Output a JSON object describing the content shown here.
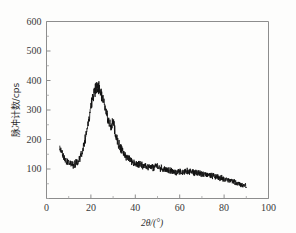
{
  "chart_data": {
    "type": "line",
    "title": "",
    "subtitle": "",
    "xlabel": "2θ/(°)",
    "ylabel": "脉冲计数/cps",
    "xlim": [
      0,
      100
    ],
    "ylim": [
      0,
      600
    ],
    "xticks": [
      0,
      20,
      40,
      60,
      80,
      100
    ],
    "xtick_labels": [
      "0",
      "20",
      "40",
      "60",
      "80",
      "100"
    ],
    "yticks": [
      100,
      200,
      300,
      400,
      500,
      600
    ],
    "ytick_labels": [
      "100",
      "200",
      "300",
      "400",
      "500",
      "600"
    ],
    "x_minor_step": 10,
    "y_minor_step": 50,
    "grid": false,
    "legend": null,
    "series_name": "XRD intensity",
    "series_color": "#111111",
    "noise_amplitude": 13,
    "x": [
      6,
      7,
      8,
      9,
      10,
      11,
      12,
      13,
      14,
      15,
      16,
      17,
      18,
      19,
      20,
      21,
      22,
      23,
      24,
      25,
      26,
      27,
      28,
      29,
      30,
      31,
      32,
      33,
      34,
      35,
      36,
      37,
      38,
      39,
      40,
      42,
      44,
      46,
      48,
      50,
      52,
      54,
      56,
      58,
      60,
      62,
      64,
      66,
      68,
      70,
      72,
      74,
      76,
      78,
      80,
      82,
      84,
      86,
      88,
      90
    ],
    "y": [
      172,
      152,
      138,
      128,
      122,
      118,
      116,
      118,
      124,
      136,
      155,
      186,
      225,
      268,
      310,
      345,
      372,
      382,
      372,
      350,
      322,
      292,
      262,
      238,
      268,
      222,
      196,
      178,
      164,
      152,
      142,
      134,
      128,
      124,
      120,
      114,
      110,
      106,
      104,
      112,
      100,
      96,
      94,
      92,
      90,
      90,
      92,
      88,
      86,
      84,
      80,
      78,
      74,
      70,
      66,
      62,
      58,
      52,
      46,
      44
    ],
    "annotations": [
      {
        "label": "broad amorphous halo",
        "x": 23,
        "y": 382
      },
      {
        "label": "sharp reflection",
        "x": 30,
        "y": 300
      }
    ]
  },
  "figure": {
    "background": "#fdfdfc",
    "frame_color": "#8d8d8d",
    "curve_color": "#111111"
  }
}
